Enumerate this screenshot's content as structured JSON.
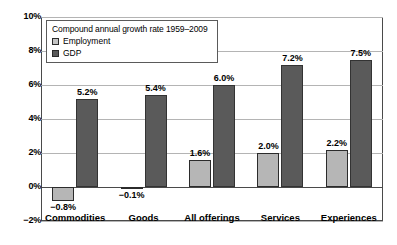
{
  "chart_data": {
    "type": "bar",
    "title": "",
    "legend_title": "Compound annual growth rate 1959–2009",
    "legend_position": "inside-top-left",
    "grid": true,
    "xlabel": "",
    "ylabel": "",
    "ylim": [
      -2,
      10
    ],
    "yticks": [
      "-2%",
      "0%",
      "2%",
      "4%",
      "6%",
      "8%",
      "10%"
    ],
    "ytick_values": [
      -2,
      0,
      2,
      4,
      6,
      8,
      10
    ],
    "categories": [
      "Commodities",
      "Goods",
      "All offerings",
      "Services",
      "Experiences"
    ],
    "series": [
      {
        "name": "Employment",
        "color": "#b6b6b6",
        "values": [
          -0.8,
          -0.1,
          1.6,
          2.0,
          2.2
        ],
        "labels": [
          "−0.8%",
          "−0.1%",
          "1.6%",
          "2.0%",
          "2.2%"
        ]
      },
      {
        "name": "GDP",
        "color": "#5a5a5a",
        "values": [
          5.2,
          5.4,
          6.0,
          7.2,
          7.5
        ],
        "labels": [
          "5.2%",
          "5.4%",
          "6.0%",
          "7.2%",
          "7.5%"
        ]
      }
    ]
  },
  "axis": {
    "y_ticks": [
      {
        "label": "10%",
        "value": 10
      },
      {
        "label": "8%",
        "value": 8
      },
      {
        "label": "6%",
        "value": 6
      },
      {
        "label": "4%",
        "value": 4
      },
      {
        "label": "2%",
        "value": 2
      },
      {
        "label": "0%",
        "value": 0
      },
      {
        "label": "−2%",
        "value": -2
      }
    ]
  },
  "legend": {
    "title": "Compound annual growth rate 1959–2009",
    "items": [
      {
        "label": "Employment",
        "color": "#c4c4c4"
      },
      {
        "label": "GDP",
        "color": "#5a5a5a"
      }
    ]
  },
  "colors": {
    "employment": "#b6b6b6",
    "gdp": "#5a5a5a",
    "grid": "#b4b4b4",
    "axis": "#4a4a4a",
    "background": "#ffffff"
  }
}
